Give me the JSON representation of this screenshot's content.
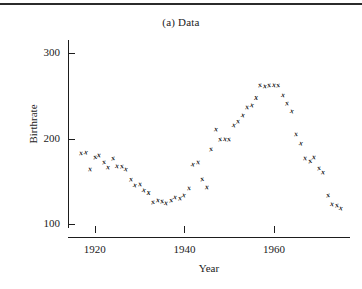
{
  "figure": {
    "title": "(a) Data",
    "has_top_rule": true
  },
  "axes": {
    "y_label": "Birthrate",
    "x_label": "Year",
    "y_ticks": [
      100,
      200,
      300
    ],
    "x_ticks": [
      1920,
      1940,
      1960
    ]
  },
  "chart_data": {
    "type": "scatter",
    "title": "(a) Data",
    "xlabel": "Year",
    "ylabel": "Birthrate",
    "xlim": [
      1914,
      1977
    ],
    "ylim": [
      85,
      315
    ],
    "yticks": [
      100,
      200,
      300
    ],
    "xticks": [
      1920,
      1940,
      1960
    ],
    "grid": false,
    "legend": "none",
    "marker": "x",
    "series": [
      {
        "name": "Birthrate",
        "points": [
          [
            1917,
            183
          ],
          [
            1918,
            184
          ],
          [
            1919,
            164
          ],
          [
            1920,
            178
          ],
          [
            1921,
            181
          ],
          [
            1922,
            173
          ],
          [
            1923,
            167
          ],
          [
            1924,
            177
          ],
          [
            1925,
            168
          ],
          [
            1926,
            168
          ],
          [
            1927,
            164
          ],
          [
            1928,
            153
          ],
          [
            1929,
            146
          ],
          [
            1930,
            147
          ],
          [
            1931,
            140
          ],
          [
            1932,
            136
          ],
          [
            1933,
            126
          ],
          [
            1934,
            128
          ],
          [
            1935,
            127
          ],
          [
            1936,
            125
          ],
          [
            1937,
            128
          ],
          [
            1938,
            132
          ],
          [
            1939,
            130
          ],
          [
            1940,
            134
          ],
          [
            1941,
            142
          ],
          [
            1942,
            170
          ],
          [
            1943,
            172
          ],
          [
            1944,
            153
          ],
          [
            1945,
            143
          ],
          [
            1946,
            188
          ],
          [
            1947,
            211
          ],
          [
            1948,
            200
          ],
          [
            1949,
            200
          ],
          [
            1950,
            199
          ],
          [
            1951,
            216
          ],
          [
            1952,
            220
          ],
          [
            1953,
            228
          ],
          [
            1954,
            237
          ],
          [
            1955,
            239
          ],
          [
            1956,
            247
          ],
          [
            1957,
            263
          ],
          [
            1958,
            261
          ],
          [
            1959,
            262
          ],
          [
            1960,
            263
          ],
          [
            1961,
            262
          ],
          [
            1962,
            251
          ],
          [
            1963,
            241
          ],
          [
            1964,
            232
          ],
          [
            1965,
            205
          ],
          [
            1966,
            195
          ],
          [
            1967,
            177
          ],
          [
            1968,
            174
          ],
          [
            1969,
            178
          ],
          [
            1970,
            166
          ],
          [
            1971,
            161
          ],
          [
            1972,
            134
          ],
          [
            1973,
            124
          ],
          [
            1974,
            122
          ],
          [
            1975,
            119
          ]
        ]
      }
    ]
  }
}
